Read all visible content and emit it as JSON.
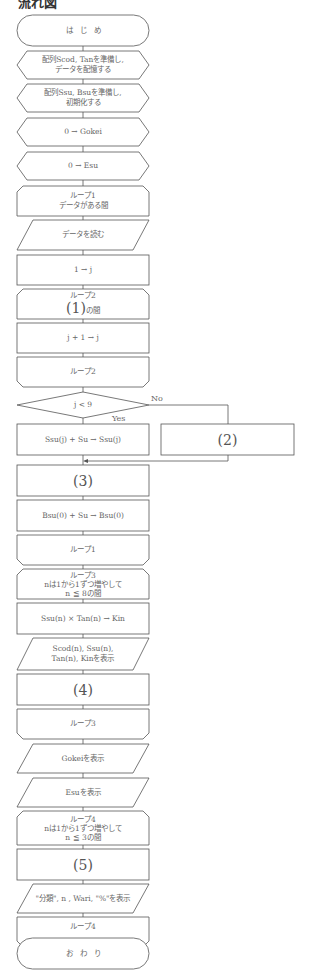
{
  "title": "流れ図",
  "nodes": {
    "start": "は　じ　め",
    "prep1_l1": "配列Scod, Tanを準備し,",
    "prep1_l2": "データを配憶する",
    "prep2_l1": "配列Ssu, Bsuを準備し,",
    "prep2_l2": "初期化する",
    "init_gokei": "0 → Gokei",
    "init_esu": "0 → Esu",
    "loop1_l1": "ループ1",
    "loop1_l2": "データがある間",
    "read": "データを読む",
    "set_j": "1 → j",
    "loop2_l1": "ループ2",
    "loop2_blank": "(1)",
    "loop2_suffix": "の間",
    "inc_j": "j + 1 → j",
    "loop2_end": "ループ2",
    "decision": "j < 9",
    "decision_no": "No",
    "decision_yes": "Yes",
    "ssu_add": "Ssu(j) + Su → Ssu(j)",
    "blank2": "(2)",
    "blank3": "(3)",
    "bsu_add": "Bsu(0) + Su → Bsu(0)",
    "loop1_end": "ループ1",
    "loop3_l1": "ループ3",
    "loop3_l2": "nは1から1ずつ増やして",
    "loop3_l3": "n ≦ 8の間",
    "kin_calc": "Ssu(n) × Tan(n) → Kin",
    "disp1_l1": "Scod(n), Ssu(n),",
    "disp1_l2": "Tan(n), Kinを表示",
    "blank4": "(4)",
    "loop3_end": "ループ3",
    "disp_gokei": "Gokeiを表示",
    "disp_esu": "Esuを表示",
    "loop4_l1": "ループ4",
    "loop4_l2": "nは1から1ずつ増やして",
    "loop4_l3": "n ≦ 3の間",
    "blank5": "(5)",
    "disp_wari": "\"分類\", n , Wari, \"%\"を表示",
    "loop4_end": "ループ4",
    "end": "お　わ　り"
  },
  "colors": {
    "line": "#555555",
    "text": "#555555",
    "background": "#ffffff"
  }
}
